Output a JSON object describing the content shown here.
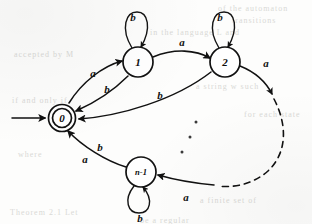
{
  "figure": {
    "kind": "finite-automaton-state-diagram",
    "alphabet": [
      "a",
      "b"
    ],
    "background_note": "scanned book page with faint bleed-through text"
  },
  "states": [
    {
      "id": "0",
      "label": "0",
      "accepting": true,
      "start": true,
      "cx": 62,
      "cy": 118
    },
    {
      "id": "1",
      "label": "1",
      "accepting": false,
      "start": false,
      "cx": 138,
      "cy": 62
    },
    {
      "id": "2",
      "label": "2",
      "accepting": false,
      "start": false,
      "cx": 225,
      "cy": 62
    },
    {
      "id": "n-1",
      "label": "n-1",
      "accepting": false,
      "start": false,
      "cx": 141,
      "cy": 172
    }
  ],
  "self_loops": [
    {
      "state": "1",
      "label": "b",
      "position": "above"
    },
    {
      "state": "2",
      "label": "b",
      "position": "above"
    },
    {
      "state": "n-1",
      "label": "b",
      "position": "below"
    }
  ],
  "transitions": [
    {
      "from": "0",
      "to": "1",
      "label": "a",
      "style": "solid"
    },
    {
      "from": "1",
      "to": "0",
      "label": "b",
      "style": "solid"
    },
    {
      "from": "1",
      "to": "2",
      "label": "a",
      "style": "solid"
    },
    {
      "from": "2",
      "to": "0",
      "label": "b",
      "style": "solid"
    },
    {
      "from": "2",
      "to": "...",
      "label": "a",
      "style": "dashed"
    },
    {
      "from": "...",
      "to": "n-1",
      "label": "a",
      "style": "solid"
    },
    {
      "from": "n-1",
      "to": "0",
      "label": "b",
      "style": "solid"
    },
    {
      "from": "n-1",
      "to": "0",
      "label": "a",
      "style": "solid"
    }
  ],
  "edge_labels": {
    "loop_1_b": "b",
    "loop_2_b": "b",
    "loop_n_b": "b",
    "zero_to_one_a": "a",
    "one_to_zero_b": "b",
    "one_to_two_a": "a",
    "two_to_zero_b": "b",
    "two_out_a": "a",
    "into_n_a": "a",
    "n_to_zero_b": "b",
    "n_to_zero_a": "a"
  },
  "state_labels": {
    "zero": "0",
    "one": "1",
    "two": "2",
    "n_minus_one": "n-1"
  },
  "ellipsis": {
    "dots": 3,
    "meaning": "intermediate states omitted"
  },
  "ghost_text": [
    {
      "text": "of the automaton",
      "x": 218,
      "y": 4
    },
    {
      "text": "transitions",
      "x": 232,
      "y": 16
    },
    {
      "text": "in the language L and",
      "x": 150,
      "y": 28
    },
    {
      "text": "accepted by M",
      "x": 14,
      "y": 50
    },
    {
      "text": "a string w such",
      "x": 196,
      "y": 82
    },
    {
      "text": "if and only if",
      "x": 12,
      "y": 96
    },
    {
      "text": "for each state",
      "x": 244,
      "y": 110
    },
    {
      "text": "where",
      "x": 18,
      "y": 150
    },
    {
      "text": "a finite set of",
      "x": 200,
      "y": 196
    },
    {
      "text": "Theorem 2.1 Let",
      "x": 10,
      "y": 208
    },
    {
      "text": "be a regular",
      "x": 140,
      "y": 216
    }
  ],
  "colors": {
    "ink": "#111111",
    "paper": "#fdfdfc",
    "ghost": "#d9d9d6"
  }
}
